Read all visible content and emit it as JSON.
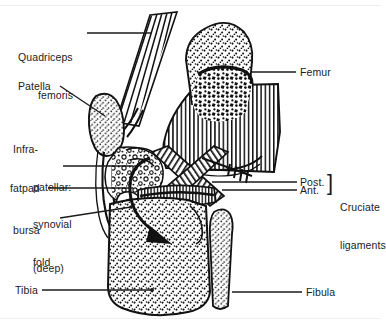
{
  "figure": {
    "style": "black-and-white line drawing with stipple and hatch shading",
    "background_color": "#ffffff",
    "ink_color": "#111111"
  },
  "labels": {
    "quadriceps": {
      "line1": "Quadriceps",
      "line2": "femoris"
    },
    "patella": {
      "text": "Patella"
    },
    "infrapatellar": {
      "line1": "Infra-",
      "line2": "patellar:",
      "line3": "synovial",
      "line4": "fold"
    },
    "fatpad": {
      "text": "fatpad"
    },
    "bursa": {
      "line1": "bursa",
      "line2": "(deep)"
    },
    "tibia": {
      "text": "Tibia"
    },
    "femur": {
      "text": "Femur"
    },
    "cruciate": {
      "posterior": "Post.",
      "anterior": "Ant.",
      "bracket": "]",
      "group_line1": "Cruciate",
      "group_line2": "ligaments"
    },
    "fibula": {
      "text": "Fibula"
    }
  },
  "structures": [
    {
      "name": "quadriceps-femoris-tendon",
      "region": "upper-left, converging fiber bundle"
    },
    {
      "name": "patella",
      "region": "left of joint, stippled oval sesamoid bone"
    },
    {
      "name": "femur",
      "region": "upper-right, stippled epiphysis with hatched shaft and dark marrow"
    },
    {
      "name": "infrapatellar-synovial-fold",
      "region": "below patella"
    },
    {
      "name": "infrapatellar-fatpad",
      "region": "cell-stippled area behind patellar tendon"
    },
    {
      "name": "deep-infrapatellar-bursa",
      "region": "small sac anterior to tibia"
    },
    {
      "name": "anterior-cruciate-ligament",
      "region": "joint centre, hatched crossing band"
    },
    {
      "name": "posterior-cruciate-ligament",
      "region": "joint centre, hatched crossing band"
    },
    {
      "name": "tibia",
      "region": "lower centre, large stippled bone"
    },
    {
      "name": "fibula",
      "region": "lower right, narrow stippled bone"
    },
    {
      "name": "joint-cavity-arrow",
      "region": "curved arrow sweeping into joint cavity"
    },
    {
      "name": "cruciate-pointer-arrow",
      "region": "feathered arrow from right toward cruciate ligaments"
    }
  ]
}
